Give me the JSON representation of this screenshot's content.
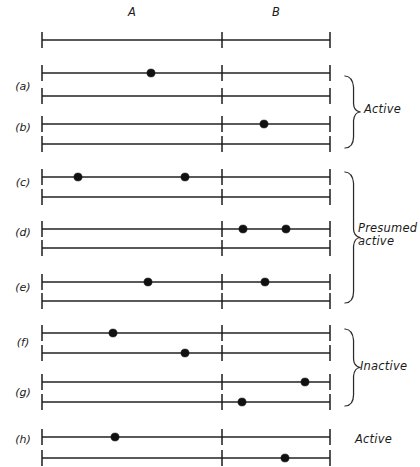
{
  "figure": {
    "background_color": "#ffffff",
    "ink_color": "#111111"
  },
  "axis": {
    "left_x": 42,
    "mid_x": 222,
    "right_x": 330,
    "tick_half_height": 8,
    "headers": [
      {
        "label": "A",
        "x": 132,
        "y": 16
      },
      {
        "label": "B",
        "x": 276,
        "y": 16
      }
    ],
    "reference_line_y": 40
  },
  "rows": [
    {
      "id": "a",
      "label": "(a)",
      "label_x": 23,
      "label_y": 90,
      "lines": [
        {
          "y": 73,
          "dots": [
            151
          ]
        },
        {
          "y": 96,
          "dots": []
        }
      ]
    },
    {
      "id": "b",
      "label": "(b)",
      "label_x": 23,
      "label_y": 131,
      "lines": [
        {
          "y": 124,
          "dots": [
            264
          ]
        },
        {
          "y": 144,
          "dots": []
        }
      ]
    },
    {
      "id": "c",
      "label": "(c)",
      "label_x": 23,
      "label_y": 186,
      "lines": [
        {
          "y": 177,
          "dots": [
            78,
            185
          ]
        },
        {
          "y": 197,
          "dots": []
        }
      ]
    },
    {
      "id": "d",
      "label": "(d)",
      "label_x": 23,
      "label_y": 236,
      "lines": [
        {
          "y": 229,
          "dots": [
            243,
            286
          ]
        },
        {
          "y": 248,
          "dots": []
        }
      ]
    },
    {
      "id": "e",
      "label": "(e)",
      "label_x": 23,
      "label_y": 291,
      "lines": [
        {
          "y": 282,
          "dots": [
            148,
            265
          ]
        },
        {
          "y": 301,
          "dots": []
        }
      ]
    },
    {
      "id": "f",
      "label": "(f)",
      "label_x": 23,
      "label_y": 346,
      "lines": [
        {
          "y": 333,
          "dots": [
            113
          ]
        },
        {
          "y": 353,
          "dots": [
            185
          ]
        }
      ]
    },
    {
      "id": "g",
      "label": "(g)",
      "label_x": 23,
      "label_y": 396,
      "lines": [
        {
          "y": 382,
          "dots": [
            305
          ]
        },
        {
          "y": 402,
          "dots": [
            242
          ]
        }
      ]
    },
    {
      "id": "h",
      "label": "(h)",
      "label_x": 23,
      "label_y": 443,
      "lines": [
        {
          "y": 437,
          "dots": [
            115
          ]
        },
        {
          "y": 458,
          "dots": [
            285
          ]
        }
      ]
    }
  ],
  "dot_radius": 4.1,
  "groups": [
    {
      "id": "active-top",
      "label": "Active",
      "label_lines": [
        "Active"
      ],
      "label_x": 364,
      "label_y": 113,
      "brace": {
        "x": 345,
        "y_top": 76,
        "y_bottom": 148,
        "width": 9
      }
    },
    {
      "id": "presumed-active",
      "label": "Presumed active",
      "label_lines": [
        "Presumed",
        "active"
      ],
      "label_x": 358,
      "label_y": 232,
      "brace": {
        "x": 345,
        "y_top": 172,
        "y_bottom": 303,
        "width": 9
      }
    },
    {
      "id": "inactive",
      "label": "Inactive",
      "label_lines": [
        "Inactive"
      ],
      "label_x": 360,
      "label_y": 370,
      "brace": {
        "x": 345,
        "y_top": 329,
        "y_bottom": 406,
        "width": 9
      }
    },
    {
      "id": "active-bottom",
      "label": "Active",
      "label_lines": [
        "Active"
      ],
      "label_x": 355,
      "label_y": 443,
      "brace": null
    }
  ]
}
